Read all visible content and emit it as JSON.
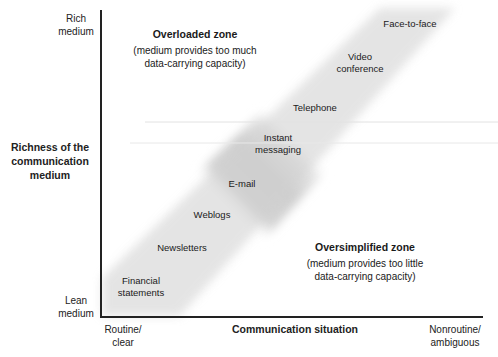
{
  "y_axis": {
    "title": [
      "Richness of the",
      "communication",
      "medium"
    ],
    "top_label": [
      "Rich",
      "medium"
    ],
    "bottom_label": [
      "Lean",
      "medium"
    ]
  },
  "x_axis": {
    "title": "Communication situation",
    "left_label": [
      "Routine/",
      "clear"
    ],
    "right_label": [
      "Nonroutine/",
      "ambiguous"
    ]
  },
  "zones": {
    "overloaded": {
      "title": "Overloaded zone",
      "description": [
        "(medium provides too much",
        "data-carrying capacity)"
      ]
    },
    "oversimplified": {
      "title": "Oversimplified zone",
      "description": [
        "(medium provides too little",
        "data-carrying capacity)"
      ]
    }
  },
  "media": [
    {
      "lines": [
        "Face-to-face"
      ]
    },
    {
      "lines": [
        "Video",
        "conference"
      ]
    },
    {
      "lines": [
        "Telephone"
      ]
    },
    {
      "lines": [
        "Instant",
        "messaging"
      ]
    },
    {
      "lines": [
        "E-mail"
      ]
    },
    {
      "lines": [
        "Weblogs"
      ]
    },
    {
      "lines": [
        "Newsletters"
      ]
    },
    {
      "lines": [
        "Financial",
        "statements"
      ]
    }
  ],
  "colors": {
    "band": "#c8c8c8",
    "axis": "#222222",
    "background": "#ffffff"
  }
}
